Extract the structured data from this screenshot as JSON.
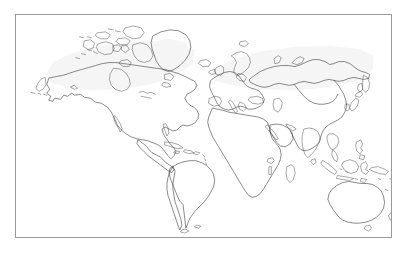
{
  "page": {
    "background_color": "#ffffff",
    "width": 408,
    "height": 255
  },
  "map": {
    "title": "",
    "frame": {
      "border_color": "#9a9a9a",
      "background_color": "#ffffff",
      "left": 15,
      "top": 14,
      "width": 377,
      "height": 224
    },
    "style": {
      "projection": "equirectangular",
      "coastline_color": "#2b2b2b",
      "land_fill_color": "#ffffff",
      "land_wash_color": "#efefef",
      "ocean_color": "#ffffff",
      "graticule": false,
      "labels": false,
      "legend": false
    },
    "regions": [
      {
        "name": "north-america",
        "label": "North America"
      },
      {
        "name": "greenland",
        "label": "Greenland"
      },
      {
        "name": "canadian-arctic-archipelago",
        "label": "Canadian Arctic Archipelago"
      },
      {
        "name": "central-america",
        "label": "Central America"
      },
      {
        "name": "caribbean",
        "label": "Caribbean Islands"
      },
      {
        "name": "south-america",
        "label": "South America"
      },
      {
        "name": "europe",
        "label": "Europe"
      },
      {
        "name": "scandinavia",
        "label": "Scandinavia"
      },
      {
        "name": "british-isles",
        "label": "British Isles"
      },
      {
        "name": "iceland",
        "label": "Iceland"
      },
      {
        "name": "africa",
        "label": "Africa"
      },
      {
        "name": "madagascar",
        "label": "Madagascar"
      },
      {
        "name": "arabian-peninsula",
        "label": "Arabian Peninsula"
      },
      {
        "name": "asia",
        "label": "Asia"
      },
      {
        "name": "russia",
        "label": "Russia"
      },
      {
        "name": "india",
        "label": "India"
      },
      {
        "name": "china",
        "label": "China"
      },
      {
        "name": "japan",
        "label": "Japan"
      },
      {
        "name": "southeast-asia",
        "label": "Southeast Asia"
      },
      {
        "name": "indonesia",
        "label": "Indonesian Archipelago"
      },
      {
        "name": "philippines",
        "label": "Philippines"
      },
      {
        "name": "new-guinea",
        "label": "New Guinea"
      },
      {
        "name": "australia",
        "label": "Australia"
      },
      {
        "name": "new-zealand",
        "label": "New Zealand"
      },
      {
        "name": "sri-lanka",
        "label": "Sri Lanka"
      },
      {
        "name": "pacific-islands",
        "label": "Pacific Islands"
      }
    ]
  }
}
